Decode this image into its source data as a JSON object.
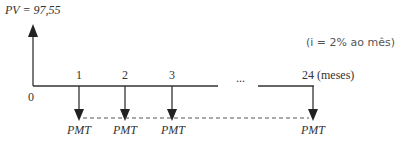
{
  "present_value": {
    "label": "PV = 97,55"
  },
  "rate_note": "(i = 2% ao mês)",
  "axis": {
    "origin_label": "0",
    "tick_labels": [
      "1",
      "2",
      "3",
      "24 (meses)"
    ],
    "ellipsis": "..."
  },
  "payments": {
    "labels": [
      "PMT",
      "PMT",
      "PMT",
      "PMT"
    ]
  },
  "colors": {
    "line": "#333333",
    "dash": "#555555"
  }
}
